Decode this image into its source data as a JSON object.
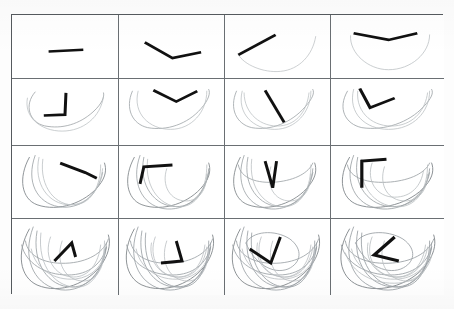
{
  "figure": {
    "title": "",
    "caption": "",
    "grid": {
      "rows": 4,
      "cols": 4,
      "cell_count": 16,
      "read_order": "left-to-right, top-to-bottom"
    },
    "colors": {
      "background": "#ffffff",
      "page": "#fdfdfd",
      "grid_border": "#555a5e",
      "cell_divider": "#6a6f73",
      "arm_stroke": "#111111",
      "trace_stroke": "#9aa0a4",
      "trace_faded": "#b8bdc0",
      "trace_dark": "#7e8488"
    }
  },
  "chart_data": {
    "type": "line",
    "title": "",
    "xlabel": "",
    "ylabel": "",
    "grid": true,
    "legend": "none",
    "panels": [
      {
        "index": 1,
        "row": 1,
        "col": 1,
        "label": "1",
        "trace_count": 0,
        "arm_segments": 1,
        "arm_points": [
          [
            38,
            44
          ],
          [
            74,
            42
          ]
        ],
        "traces": []
      },
      {
        "index": 2,
        "row": 1,
        "col": 2,
        "label": "2",
        "trace_count": 0,
        "arm_segments": 2,
        "arm_points": [
          [
            27,
            33
          ],
          [
            56,
            52
          ],
          [
            86,
            45
          ]
        ],
        "traces": []
      },
      {
        "index": 3,
        "row": 1,
        "col": 3,
        "label": "3",
        "trace_count": 1,
        "arm_segments": 1,
        "arm_points": [
          [
            14,
            48
          ],
          [
            53,
            24
          ]
        ],
        "traces": [
          {
            "name": "orbit-1",
            "style": "faded",
            "path": "M14,48 C20,60 40,70 58,68 C78,66 92,48 95,26"
          }
        ]
      },
      {
        "index": 4,
        "row": 1,
        "col": 4,
        "label": "4",
        "trace_count": 1,
        "arm_segments": 2,
        "arm_points": [
          [
            22,
            22
          ],
          [
            56,
            30
          ],
          [
            84,
            22
          ]
        ],
        "traces": [
          {
            "name": "orbit-1",
            "style": "faded",
            "path": "M19,25 C18,46 36,66 56,66 C78,66 96,46 96,24"
          }
        ]
      },
      {
        "index": 5,
        "row": 2,
        "col": 1,
        "label": "5",
        "trace_count": 1,
        "arm_segments": 2,
        "arm_points": [
          [
            56,
            16
          ],
          [
            55,
            41
          ],
          [
            33,
            42
          ]
        ],
        "traces": [
          {
            "name": "orbit-1",
            "style": "trace",
            "path": "M24,15 C12,30 18,50 34,54 C52,58 70,52 84,38 C94,28 96,20 95,16"
          },
          {
            "name": "orbit-1b",
            "style": "faded",
            "path": "M16,22 C12,44 30,60 52,60 C74,60 92,44 95,20"
          }
        ]
      },
      {
        "index": 6,
        "row": 2,
        "col": 2,
        "label": "6",
        "trace_count": 2,
        "arm_segments": 2,
        "arm_points": [
          [
            36,
            13
          ],
          [
            60,
            26
          ],
          [
            82,
            14
          ]
        ],
        "traces": [
          {
            "name": "orbit-1",
            "style": "trace",
            "path": "M14,14 C6,34 14,52 30,56 C50,60 72,52 86,34 C94,24 96,16 94,12"
          },
          {
            "name": "orbit-2",
            "style": "faded",
            "path": "M20,14 C14,40 32,58 54,58 C76,58 92,38 92,14"
          }
        ]
      },
      {
        "index": 7,
        "row": 2,
        "col": 3,
        "label": "7",
        "trace_count": 2,
        "arm_segments": 1,
        "arm_points": [
          [
            42,
            13
          ],
          [
            62,
            50
          ]
        ],
        "traces": [
          {
            "name": "orbit-1",
            "style": "trace",
            "path": "M12,14 C4,34 12,52 28,56 C48,60 70,50 84,32 C92,22 94,16 92,12"
          },
          {
            "name": "orbit-2",
            "style": "faded",
            "path": "M18,14 C12,40 30,58 52,58 C74,58 90,38 90,14"
          },
          {
            "name": "orbit-3",
            "style": "faded",
            "path": "M20,16 C20,40 38,56 58,54 C76,52 86,36 88,16"
          }
        ]
      },
      {
        "index": 8,
        "row": 2,
        "col": 4,
        "label": "8",
        "trace_count": 3,
        "arm_segments": 2,
        "arm_points": [
          [
            28,
            11
          ],
          [
            38,
            33
          ],
          [
            62,
            22
          ]
        ],
        "traces": [
          {
            "name": "orbit-1",
            "style": "trace",
            "path": "M16,14 C6,34 14,52 30,56 C52,60 76,50 90,32 C98,22 100,16 98,12"
          },
          {
            "name": "orbit-2",
            "style": "faded",
            "path": "M22,12 C16,40 34,58 56,58 C80,58 96,38 96,14"
          },
          {
            "name": "orbit-3",
            "style": "faded",
            "path": "M26,14 C24,40 42,56 62,54 C82,52 92,34 94,16"
          }
        ]
      },
      {
        "index": 9,
        "row": 3,
        "col": 1,
        "label": "9",
        "trace_count": 4,
        "arm_segments": 2,
        "arm_points": [
          [
            50,
            18
          ],
          [
            76,
            28
          ],
          [
            88,
            34
          ]
        ],
        "traces": [
          {
            "name": "orbit-1",
            "style": "dark",
            "path": "M18,12 C6,34 10,56 26,62 C48,70 76,60 90,42 C98,32 98,24 96,18"
          },
          {
            "name": "orbit-2",
            "style": "trace",
            "path": "M24,10 C14,38 26,60 48,64 C70,68 90,52 94,28"
          },
          {
            "name": "orbit-3",
            "style": "faded",
            "path": "M28,12 C22,40 38,62 60,62 C80,62 92,44 94,24"
          },
          {
            "name": "orbit-4",
            "style": "faded",
            "path": "M32,14 C28,44 46,64 66,62 C84,60 92,40 92,20"
          }
        ]
      },
      {
        "index": 10,
        "row": 3,
        "col": 2,
        "label": "10",
        "trace_count": 5,
        "arm_segments": 2,
        "arm_points": [
          [
            22,
            40
          ],
          [
            26,
            22
          ],
          [
            56,
            20
          ]
        ],
        "traces": [
          {
            "name": "orbit-1",
            "style": "dark",
            "path": "M16,12 C4,34 8,56 24,62 C46,70 74,60 88,42 C96,32 96,24 94,18"
          },
          {
            "name": "orbit-2",
            "style": "trace",
            "path": "M22,10 C12,38 24,62 46,66 C70,70 90,52 94,28"
          },
          {
            "name": "orbit-3",
            "style": "trace",
            "path": "M26,12 C20,42 38,64 60,64 C80,64 92,46 94,24"
          },
          {
            "name": "orbit-4",
            "style": "faded",
            "path": "M30,14 C26,46 46,66 66,64 C84,62 92,42 92,20"
          },
          {
            "name": "orbit-5",
            "style": "faded",
            "path": "M50,24 C44,42 54,58 70,58 C84,58 92,46 92,30"
          }
        ]
      },
      {
        "index": 11,
        "row": 3,
        "col": 3,
        "label": "11",
        "trace_count": 6,
        "arm_segments": 2,
        "arm_points": [
          [
            42,
            16
          ],
          [
            50,
            44
          ],
          [
            54,
            16
          ]
        ],
        "traces": [
          {
            "name": "orbit-1",
            "style": "dark",
            "path": "M16,12 C4,34 8,56 24,62 C46,70 74,60 88,42 C96,32 96,24 94,18"
          },
          {
            "name": "orbit-2",
            "style": "trace",
            "path": "M20,10 C10,38 22,62 44,66 C68,70 88,52 92,28"
          },
          {
            "name": "orbit-3",
            "style": "trace",
            "path": "M24,12 C18,42 36,64 58,64 C78,64 90,46 92,24"
          },
          {
            "name": "orbit-4",
            "style": "trace",
            "path": "M14,20 C16,34 34,40 54,38 C74,36 88,28 92,18"
          },
          {
            "name": "orbit-5",
            "style": "faded",
            "path": "M28,14 C24,46 44,66 64,64 C82,62 90,42 90,20"
          },
          {
            "name": "orbit-6",
            "style": "faded",
            "path": "M48,22 C42,42 52,58 68,58 C82,58 90,46 90,30"
          }
        ]
      },
      {
        "index": 12,
        "row": 3,
        "col": 4,
        "label": "12",
        "trace_count": 7,
        "arm_segments": 2,
        "arm_points": [
          [
            30,
            44
          ],
          [
            30,
            16
          ],
          [
            54,
            14
          ]
        ],
        "traces": [
          {
            "name": "orbit-1",
            "style": "dark",
            "path": "M18,12 C6,34 10,56 26,62 C48,70 78,60 92,42 C100,32 100,24 98,18"
          },
          {
            "name": "orbit-2",
            "style": "trace",
            "path": "M22,10 C12,38 24,62 46,66 C70,70 92,52 96,28"
          },
          {
            "name": "orbit-3",
            "style": "trace",
            "path": "M26,12 C20,42 38,64 60,64 C82,64 94,46 96,24"
          },
          {
            "name": "orbit-4",
            "style": "trace",
            "path": "M16,20 C18,34 36,40 58,38 C78,36 92,28 96,18"
          },
          {
            "name": "orbit-5",
            "style": "faded",
            "path": "M30,14 C26,46 46,66 68,64 C86,62 94,42 94,20"
          },
          {
            "name": "orbit-6",
            "style": "faded",
            "path": "M52,22 C46,42 56,58 72,58 C86,58 94,46 94,30"
          },
          {
            "name": "orbit-7",
            "style": "faded",
            "path": "M40,18 C34,36 44,54 62,54 C78,54 88,42 90,26"
          }
        ]
      },
      {
        "index": 13,
        "row": 4,
        "col": 1,
        "label": "13",
        "trace_count": 9,
        "arm_segments": 2,
        "arm_points": [
          [
            44,
            42
          ],
          [
            62,
            24
          ],
          [
            66,
            38
          ]
        ],
        "traces": [
          {
            "name": "orbit-1",
            "style": "dark",
            "path": "M18,10 C4,34 8,58 26,66 C50,76 80,64 94,44 C102,32 102,22 100,16"
          },
          {
            "name": "orbit-2",
            "style": "trace",
            "path": "M22,8 C10,38 22,64 46,70 C72,76 94,56 98,28"
          },
          {
            "name": "orbit-3",
            "style": "trace",
            "path": "M26,12 C20,44 38,68 62,68 C84,68 96,48 98,24"
          },
          {
            "name": "orbit-4",
            "style": "trace",
            "path": "M14,22 C16,38 36,46 60,44 C82,42 96,32 100,20"
          },
          {
            "name": "orbit-5",
            "style": "trace",
            "path": "M10,26 C14,44 34,56 58,56 C80,56 94,44 98,28"
          },
          {
            "name": "orbit-6",
            "style": "faded",
            "path": "M30,14 C26,48 46,70 70,68 C88,66 96,44 96,22"
          },
          {
            "name": "orbit-7",
            "style": "faded",
            "path": "M52,22 C44,44 56,62 74,62 C88,62 96,48 96,30"
          },
          {
            "name": "orbit-8",
            "style": "faded",
            "path": "M40,18 C32,38 44,58 64,58 C80,58 90,44 92,26"
          },
          {
            "name": "orbit-9",
            "style": "faded",
            "path": "M20,30 C24,50 44,62 66,60 C84,58 94,46 96,34"
          }
        ]
      },
      {
        "index": 14,
        "row": 4,
        "col": 2,
        "label": "14",
        "trace_count": 10,
        "arm_segments": 2,
        "arm_points": [
          [
            60,
            22
          ],
          [
            66,
            42
          ],
          [
            44,
            44
          ]
        ],
        "traces": [
          {
            "name": "orbit-1",
            "style": "dark",
            "path": "M16,10 C2,34 6,58 24,66 C48,76 78,64 92,44 C100,32 100,22 98,16"
          },
          {
            "name": "orbit-2",
            "style": "trace",
            "path": "M20,8 C8,38 20,64 44,70 C70,76 92,56 96,28"
          },
          {
            "name": "orbit-3",
            "style": "trace",
            "path": "M24,12 C18,44 36,68 60,68 C82,68 94,48 96,24"
          },
          {
            "name": "orbit-4",
            "style": "trace",
            "path": "M12,22 C14,38 34,46 58,44 C80,42 94,32 98,20"
          },
          {
            "name": "orbit-5",
            "style": "trace",
            "path": "M8,26 C12,44 32,56 56,56 C78,56 92,44 96,28"
          },
          {
            "name": "orbit-6",
            "style": "trace",
            "path": "M28,14 C24,48 44,70 68,68 C86,66 94,44 94,22"
          },
          {
            "name": "orbit-7",
            "style": "faded",
            "path": "M50,22 C42,44 54,62 72,62 C86,62 94,48 94,30"
          },
          {
            "name": "orbit-8",
            "style": "faded",
            "path": "M38,18 C30,38 42,58 62,58 C78,58 88,44 90,26"
          },
          {
            "name": "orbit-9",
            "style": "faded",
            "path": "M18,30 C22,50 42,62 64,60 C82,58 92,46 94,34"
          },
          {
            "name": "orbit-10",
            "style": "faded",
            "path": "M34,24 C30,44 46,60 66,58 C82,56 90,42 92,28"
          }
        ]
      },
      {
        "index": 15,
        "row": 4,
        "col": 3,
        "label": "15",
        "trace_count": 11,
        "arm_segments": 2,
        "arm_points": [
          [
            26,
            30
          ],
          [
            48,
            44
          ],
          [
            58,
            18
          ]
        ],
        "traces": [
          {
            "name": "orbit-1",
            "style": "dark",
            "path": "M16,10 C2,34 6,58 24,66 C48,76 78,64 92,44 C100,32 100,22 98,16"
          },
          {
            "name": "orbit-2",
            "style": "trace",
            "path": "M20,8 C8,38 20,64 44,70 C70,76 92,56 96,28"
          },
          {
            "name": "orbit-3",
            "style": "trace",
            "path": "M24,12 C18,44 36,68 60,68 C82,68 94,48 96,24"
          },
          {
            "name": "orbit-4",
            "style": "trace",
            "path": "M12,22 C14,38 34,46 58,44 C80,42 94,32 98,20"
          },
          {
            "name": "orbit-5",
            "style": "trace",
            "path": "M8,26 C12,44 32,56 56,56 C78,56 92,44 96,28"
          },
          {
            "name": "orbit-6",
            "style": "trace",
            "path": "M28,14 C24,48 44,70 68,68 C86,66 94,44 94,22"
          },
          {
            "name": "orbit-7",
            "style": "trace",
            "path": "M22,24 C28,12 52,10 68,20 C82,30 80,44 66,50 C50,56 30,44 22,24"
          },
          {
            "name": "orbit-8",
            "style": "faded",
            "path": "M50,22 C42,44 54,62 72,62 C86,62 94,48 94,30"
          },
          {
            "name": "orbit-9",
            "style": "faded",
            "path": "M38,18 C30,38 42,58 62,58 C78,58 88,44 90,26"
          },
          {
            "name": "orbit-10",
            "style": "faded",
            "path": "M18,30 C22,50 42,62 64,60 C82,58 92,46 94,34"
          },
          {
            "name": "orbit-11",
            "style": "faded",
            "path": "M34,24 C30,44 46,60 66,58 C82,56 90,42 92,28"
          }
        ]
      },
      {
        "index": 16,
        "row": 4,
        "col": 4,
        "label": "16",
        "trace_count": 12,
        "arm_segments": 2,
        "arm_points": [
          [
            62,
            18
          ],
          [
            42,
            36
          ],
          [
            66,
            42
          ]
        ],
        "traces": [
          {
            "name": "orbit-1",
            "style": "dark",
            "path": "M18,10 C4,34 8,58 26,66 C50,76 80,64 94,44 C102,32 102,22 100,16"
          },
          {
            "name": "orbit-2",
            "style": "trace",
            "path": "M22,8 C10,38 22,64 46,70 C72,76 94,56 98,28"
          },
          {
            "name": "orbit-3",
            "style": "trace",
            "path": "M26,12 C20,44 38,68 62,68 C84,68 96,48 98,24"
          },
          {
            "name": "orbit-4",
            "style": "trace",
            "path": "M14,22 C16,38 36,46 60,44 C82,42 96,32 100,20"
          },
          {
            "name": "orbit-5",
            "style": "trace",
            "path": "M10,26 C14,44 34,56 58,56 C80,56 94,44 98,28"
          },
          {
            "name": "orbit-6",
            "style": "trace",
            "path": "M30,14 C26,48 46,70 70,68 C88,66 96,44 96,22"
          },
          {
            "name": "orbit-7",
            "style": "trace",
            "path": "M24,24 C30,12 54,10 70,20 C84,30 82,44 68,50 C52,56 32,44 24,24"
          },
          {
            "name": "orbit-8",
            "style": "faded",
            "path": "M52,22 C44,44 56,62 74,62 C88,62 96,48 96,30"
          },
          {
            "name": "orbit-9",
            "style": "faded",
            "path": "M40,18 C32,38 44,58 64,58 C80,58 90,44 92,26"
          },
          {
            "name": "orbit-10",
            "style": "faded",
            "path": "M20,30 C24,50 44,62 66,60 C84,58 94,46 96,34"
          },
          {
            "name": "orbit-11",
            "style": "faded",
            "path": "M36,24 C32,44 48,60 68,58 C84,56 92,42 94,28"
          },
          {
            "name": "orbit-12",
            "style": "faded",
            "path": "M14,34 C20,54 42,66 66,64 C86,62 96,48 98,36"
          }
        ]
      }
    ]
  }
}
